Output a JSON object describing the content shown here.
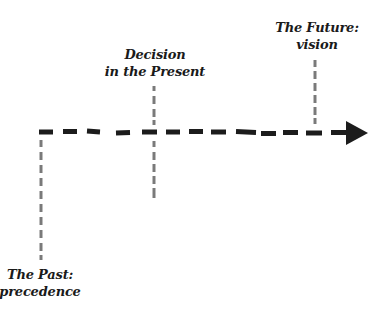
{
  "diagram": {
    "type": "timeline",
    "direction": "left-to-right",
    "colors": {
      "main_line": "#1c1c1c",
      "marker_lines": "#7a7a7a",
      "text": "#1a1a1a",
      "background": "#ffffff"
    },
    "markers": [
      {
        "id": "past",
        "line1": "The Past:",
        "line2": "precedence",
        "label_position": "below"
      },
      {
        "id": "present",
        "line1": "Decision",
        "line2": "in the Present",
        "label_position": "above"
      },
      {
        "id": "future",
        "line1": "The Future:",
        "line2": "vision",
        "label_position": "above"
      }
    ]
  }
}
